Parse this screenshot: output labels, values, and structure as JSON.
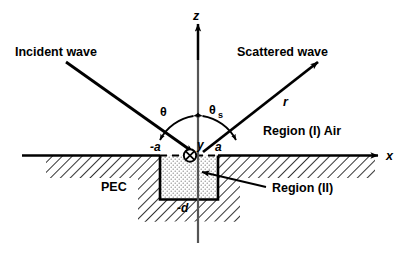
{
  "figure": {
    "type": "schematic-diagram",
    "background_color": "#ffffff",
    "line_color": "#000000"
  },
  "axes": {
    "z_label": "z",
    "x_label": "x",
    "y_label": "y",
    "origin_symbol": "circle-with-x",
    "origin_meaning": "y-axis into page"
  },
  "waves": {
    "incident_label": "Incident wave",
    "scattered_label": "Scattered wave",
    "radial_label": "r"
  },
  "angles": {
    "incident_angle": "θ",
    "scattered_angle": "θ",
    "scattered_angle_subscript": "s"
  },
  "markers": {
    "left_edge": "-a",
    "right_edge": "a",
    "depth": "-d"
  },
  "regions": {
    "upper": "Region (I)  Air",
    "lower": "Region (II)",
    "conductor": "PEC"
  }
}
